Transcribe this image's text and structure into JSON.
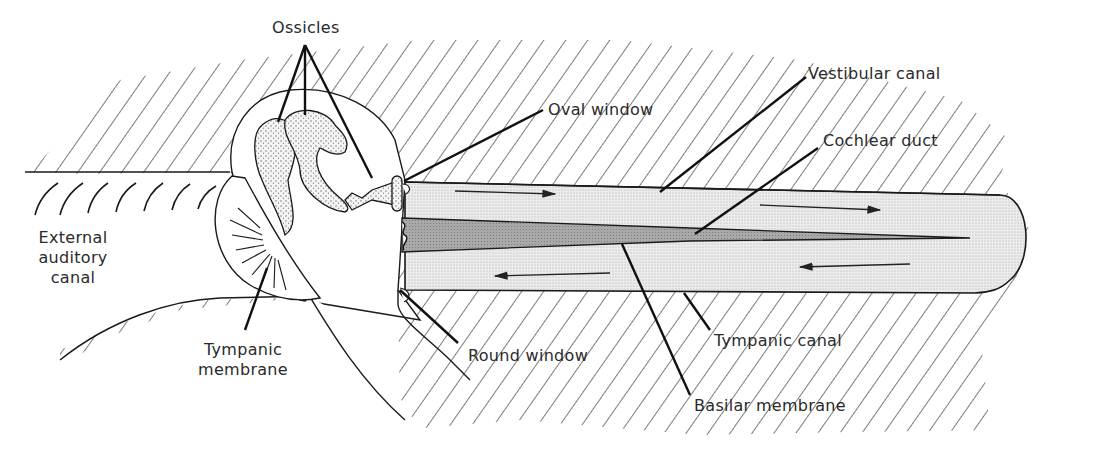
{
  "figure": {
    "colors": {
      "ink": "#1a1a1a",
      "hatch": "#222222",
      "canal_fill": "#e6e6e6",
      "duct_fill": "#a8a8a8",
      "ossicle_fill": "#d9d9d9",
      "background": "#ffffff"
    }
  },
  "labels": {
    "ossicles": "Ossicles",
    "oval_window": "Oval window",
    "vestibular_canal": "Vestibular canal",
    "cochlear_duct": "Cochlear duct",
    "external_auditory_canal": [
      "External",
      "auditory",
      "canal"
    ],
    "tympanic_membrane": [
      "Tympanic",
      "membrane"
    ],
    "round_window": "Round window",
    "tympanic_canal": "Tympanic canal",
    "basilar_membrane": "Basilar membrane"
  },
  "arrows": [
    {
      "name": "vestibular-flow-arrow-1",
      "direction": "right"
    },
    {
      "name": "vestibular-flow-arrow-2",
      "direction": "right"
    },
    {
      "name": "tympanic-flow-arrow-1",
      "direction": "left"
    },
    {
      "name": "tympanic-flow-arrow-2",
      "direction": "left"
    }
  ]
}
